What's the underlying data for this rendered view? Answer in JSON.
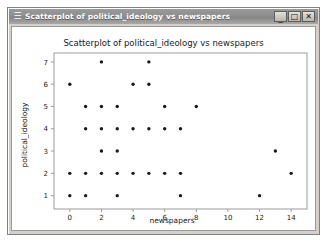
{
  "window": {
    "title": "Scatterplot of political_ideology vs newspapers",
    "menu_glyph": "☰",
    "minimize_label": "_",
    "maximize_label": "□",
    "close_label": "✕"
  },
  "chart_data": {
    "type": "scatter",
    "title": "Scatterplot of political_ideology vs newspapers",
    "xlabel": "newspapers",
    "ylabel": "political_ideology",
    "xlim": [
      -1,
      15
    ],
    "ylim": [
      0.4,
      7.4
    ],
    "xticks": [
      "0",
      "2",
      "4",
      "6",
      "8",
      "10",
      "12",
      "14"
    ],
    "xtick_values": [
      0,
      2,
      4,
      6,
      8,
      10,
      12,
      14
    ],
    "yticks": [
      "1",
      "2",
      "3",
      "4",
      "5",
      "6",
      "7"
    ],
    "ytick_values": [
      1,
      2,
      3,
      4,
      5,
      6,
      7
    ],
    "grid": false,
    "legend": null,
    "marker": "circle",
    "marker_color": "#1b1b1b",
    "points": [
      {
        "x": 2,
        "y": 7
      },
      {
        "x": 5,
        "y": 7
      },
      {
        "x": 0,
        "y": 6
      },
      {
        "x": 4,
        "y": 6
      },
      {
        "x": 5,
        "y": 6
      },
      {
        "x": 1,
        "y": 5
      },
      {
        "x": 2,
        "y": 5
      },
      {
        "x": 3,
        "y": 5
      },
      {
        "x": 6,
        "y": 5
      },
      {
        "x": 8,
        "y": 5
      },
      {
        "x": 1,
        "y": 4
      },
      {
        "x": 2,
        "y": 4
      },
      {
        "x": 3,
        "y": 4
      },
      {
        "x": 4,
        "y": 4
      },
      {
        "x": 5,
        "y": 4
      },
      {
        "x": 6,
        "y": 4
      },
      {
        "x": 7,
        "y": 4
      },
      {
        "x": 2,
        "y": 3
      },
      {
        "x": 3,
        "y": 3
      },
      {
        "x": 13,
        "y": 3
      },
      {
        "x": 0,
        "y": 2
      },
      {
        "x": 1,
        "y": 2
      },
      {
        "x": 2,
        "y": 2
      },
      {
        "x": 3,
        "y": 2
      },
      {
        "x": 4,
        "y": 2
      },
      {
        "x": 5,
        "y": 2
      },
      {
        "x": 6,
        "y": 2
      },
      {
        "x": 7,
        "y": 2
      },
      {
        "x": 14,
        "y": 2
      },
      {
        "x": 0,
        "y": 1
      },
      {
        "x": 1,
        "y": 1
      },
      {
        "x": 3,
        "y": 1
      },
      {
        "x": 7,
        "y": 1
      },
      {
        "x": 12,
        "y": 1
      }
    ]
  }
}
